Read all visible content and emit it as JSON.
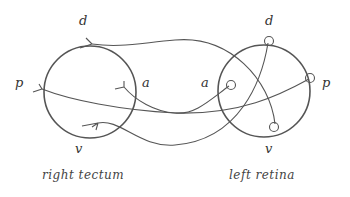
{
  "diagram": {
    "left_structure": {
      "name": "right tectum",
      "labels": {
        "dorsal": "d",
        "posterior": "p",
        "anterior": "a",
        "ventral": "v"
      }
    },
    "right_structure": {
      "name": "left retina",
      "labels": {
        "dorsal": "d",
        "anterior": "a",
        "posterior": "p",
        "ventral": "v"
      }
    },
    "connections": [
      {
        "from": "retina d",
        "to": "tectum v"
      },
      {
        "from": "retina v",
        "to": "tectum d"
      },
      {
        "from": "retina a",
        "to": "tectum a"
      },
      {
        "from": "retina p",
        "to": "tectum p"
      }
    ],
    "stroke_color": "#555555"
  }
}
